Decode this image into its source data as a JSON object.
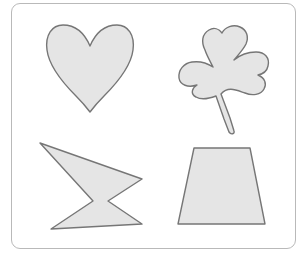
{
  "figure": {
    "frame": {
      "border_color": "#b9b9b9",
      "background": "#ffffff"
    },
    "style": {
      "fill_color": "#e5e5e5",
      "stroke_color": "#767676"
    },
    "shapes": [
      {
        "name": "heart",
        "label": "Heart",
        "position": "top-left"
      },
      {
        "name": "shamrock",
        "label": "Shamrock",
        "position": "top-right"
      },
      {
        "name": "irregular-polygon",
        "label": "Irregular hexagon",
        "position": "bottom-left"
      },
      {
        "name": "trapezoid",
        "label": "Trapezoid",
        "position": "bottom-right"
      }
    ]
  }
}
